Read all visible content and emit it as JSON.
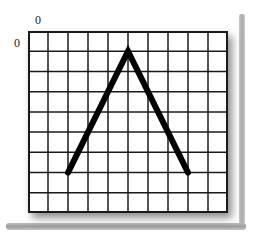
{
  "labels": {
    "x_origin": "0",
    "y_origin": "0"
  },
  "grid": {
    "columns": 10,
    "rows": 9,
    "line_color": "#1a1a1a",
    "background": "#ffffff"
  },
  "chart_data": {
    "type": "line",
    "title": "",
    "xlabel": "",
    "ylabel": "",
    "x_origin_label": "0",
    "y_origin_label": "0",
    "grid": true,
    "xlim": [
      0,
      10
    ],
    "ylim": [
      0,
      9
    ],
    "y_axis_direction": "down",
    "series": [
      {
        "name": "inverted-V",
        "color": "#000000",
        "points": [
          [
            2,
            7
          ],
          [
            5,
            1
          ],
          [
            8,
            7
          ]
        ]
      }
    ]
  }
}
